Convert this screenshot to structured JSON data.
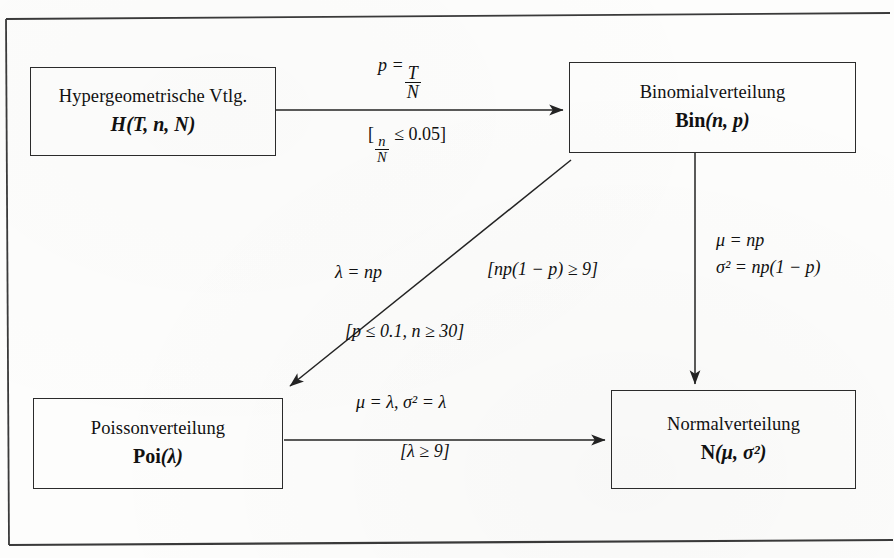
{
  "page": {
    "clipped_header": "pp",
    "frame_color": "#2b2b2b",
    "background": "#fdfdfc",
    "ink_color": "#111111"
  },
  "diagram": {
    "type": "flowchart",
    "nodes": [
      {
        "id": "hypergeometric",
        "name": "Hypergeometrische Vtlg.",
        "symbol_cal": "H",
        "symbol_args": "(T, n, N)",
        "symbol_plain": "H(T, n, N)"
      },
      {
        "id": "binomial",
        "name": "Binomialverteilung",
        "symbol_cal": "Bin",
        "symbol_args": "(n, p)",
        "symbol_plain": "Bin(n, p)"
      },
      {
        "id": "poisson",
        "name": "Poissonverteilung",
        "symbol_cal": "Poi",
        "symbol_args": "(λ)",
        "symbol_plain": "Poi(λ)"
      },
      {
        "id": "normal",
        "name": "Normalverteilung",
        "symbol_cal": "N",
        "symbol_args": "(μ, σ²)",
        "symbol_plain": "N(μ, σ²)"
      }
    ],
    "edges": [
      {
        "id": "hyper-to-binom",
        "from": "hypergeometric",
        "to": "binomial",
        "mapping_label": "p = T/N",
        "mapping_numerator": "T",
        "mapping_denominator": "N",
        "mapping_lhs": "p =",
        "condition_label": "[n/N ≤ 0.05]",
        "condition_numerator": "n",
        "condition_denominator": "N",
        "condition_rhs": "≤ 0.05]"
      },
      {
        "id": "binom-to-poisson",
        "from": "binomial",
        "to": "poisson",
        "mapping_label": "λ = np",
        "condition_label": "[p ≤ 0.1, n ≥ 30]"
      },
      {
        "id": "binom-to-normal",
        "from": "binomial",
        "to": "normal",
        "condition_label": "[np(1 − p) ≥ 9]",
        "mapping_label_mu": "μ = np",
        "mapping_label_sigma": "σ² = np(1 − p)"
      },
      {
        "id": "poisson-to-normal",
        "from": "poisson",
        "to": "normal",
        "mapping_label": "μ = λ, σ² = λ",
        "condition_label": "[λ ≥ 9]"
      }
    ]
  }
}
